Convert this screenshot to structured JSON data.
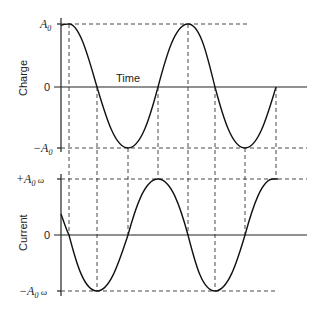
{
  "charge_panel": {
    "ylabel": "Charge",
    "xlabel": "Time",
    "tick_top": "A",
    "tick_top_sub": "0",
    "tick_zero": "0",
    "tick_bottom_prefix": "−A",
    "tick_bottom_sub": "0",
    "curve": "cosine",
    "period_px": 118
  },
  "current_panel": {
    "ylabel": "Current",
    "tick_top_prefix": "+A",
    "tick_top_sub": "0",
    "tick_top_suffix": " ω",
    "tick_zero": "0",
    "tick_bottom_prefix": "−A",
    "tick_bottom_sub": "0",
    "tick_bottom_suffix": " ω",
    "curve": "negative sine (phase-shifted by quarter period)"
  },
  "colors": {
    "ink": "#111111",
    "background": "#ffffff"
  }
}
